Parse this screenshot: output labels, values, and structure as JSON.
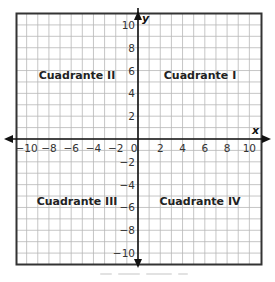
{
  "diagram": {
    "type": "coordinate-plane",
    "x_axis": {
      "label": "x",
      "range": [
        -11,
        11
      ],
      "tick_step": 1,
      "labeled_ticks": [
        "−10",
        "−8",
        "−6",
        "−4",
        "−2",
        "0",
        "2",
        "4",
        "6",
        "8",
        "10"
      ],
      "labeled_values": [
        -10,
        -8,
        -6,
        -4,
        -2,
        0,
        2,
        4,
        6,
        8,
        10
      ]
    },
    "y_axis": {
      "label": "y",
      "range": [
        -11,
        11
      ],
      "tick_step": 1,
      "labeled_ticks": [
        "10",
        "8",
        "6",
        "4",
        "2",
        "−2",
        "−4",
        "−6",
        "−8",
        "−10"
      ],
      "labeled_values": [
        10,
        8,
        6,
        4,
        2,
        -2,
        -4,
        -6,
        -8,
        -10
      ]
    },
    "quadrants": {
      "q1": "Cuadrante I",
      "q2": "Cuadrante II",
      "q3": "Cuadrante III",
      "q4": "Cuadrante IV"
    },
    "colors": {
      "grid": "#b8b8b8",
      "frame": "#333333",
      "axis": "#111111",
      "background": "#ffffff"
    }
  }
}
